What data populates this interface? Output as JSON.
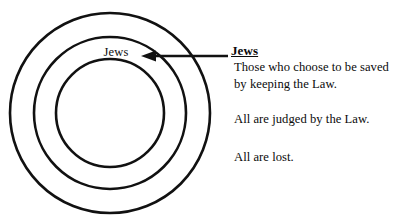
{
  "diagram": {
    "stroke_color": "#111111",
    "background_color": "#ffffff",
    "rings": [
      {
        "name": "outer-ring",
        "cx": 110,
        "cy": 113,
        "r": 100
      },
      {
        "name": "middle-ring",
        "cx": 110,
        "cy": 113,
        "r": 76
      },
      {
        "name": "inner-ring",
        "cx": 110,
        "cy": 113,
        "r": 54
      }
    ],
    "inner_label": "Jews",
    "arrow": {
      "name": "pointer-arrow",
      "direction": "left",
      "tip_x": 141,
      "tip_y": 56,
      "tail_x": 228,
      "tail_y": 56
    }
  },
  "callout": {
    "heading": "Jews",
    "paragraphs": [
      "Those who choose to be saved by keeping the Law.",
      "All are judged by the Law.",
      "All are lost."
    ]
  }
}
